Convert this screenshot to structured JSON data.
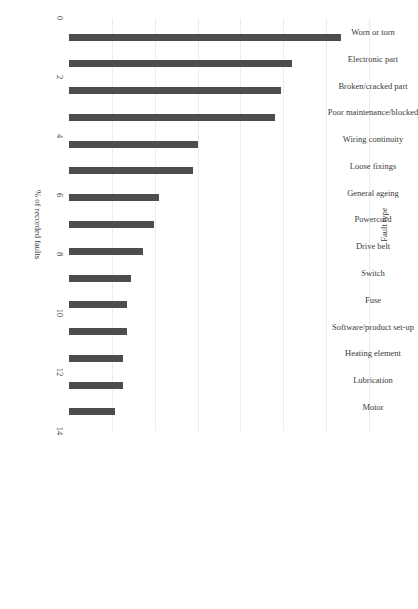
{
  "chart_data": {
    "type": "bar",
    "title": "",
    "orientation": "rotated-90",
    "xlabel": "Fault type",
    "ylabel": "% of recorded faults",
    "ylim": [
      0,
      14
    ],
    "yticks": [
      0,
      2,
      4,
      6,
      8,
      10,
      12,
      14
    ],
    "grid": true,
    "legend": null,
    "bar_color": "#4d4d4d",
    "categories": [
      "Worn or torn",
      "Electronic part",
      "Broken/cracked part",
      "Poor maintenance/blocked",
      "Wiring continuity",
      "Loose fixings",
      "General ageing",
      "Powercord",
      "Drive belt",
      "Switch",
      "Fuse",
      "Software/product set-up",
      "Heating element",
      "Lubrication",
      "Motor"
    ],
    "values": [
      12.7,
      10.4,
      9.9,
      9.6,
      6.0,
      5.8,
      4.2,
      3.95,
      3.45,
      2.9,
      2.7,
      2.7,
      2.5,
      2.5,
      2.15
    ]
  },
  "axes": {
    "value_axis_title": "% of recorded faults",
    "category_axis_title": "Fault type",
    "tick_labels": [
      "0",
      "2",
      "4",
      "6",
      "8",
      "10",
      "12",
      "14"
    ]
  }
}
